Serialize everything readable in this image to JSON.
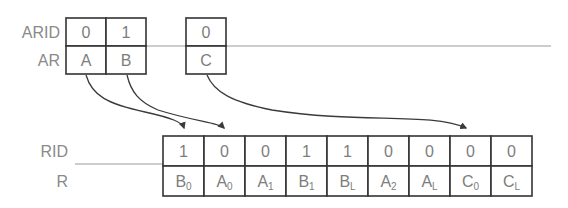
{
  "diagram": {
    "colors": {
      "background": "#ffffff",
      "box_stroke": "#333333",
      "cell_text": "#7d7d7d",
      "label_text": "#8a8a8a",
      "arrow_stroke": "#3a3a3a",
      "guide_line": "#9a9a9a"
    },
    "address_channel": {
      "labels": {
        "id_row": "ARID",
        "payload_row": "AR"
      },
      "groups": [
        {
          "name": "group-ab",
          "cells": [
            {
              "id": "0",
              "payload": "A"
            },
            {
              "id": "1",
              "payload": "B"
            }
          ]
        },
        {
          "name": "group-c",
          "cells": [
            {
              "id": "0",
              "payload": "C"
            }
          ]
        }
      ]
    },
    "read_data_channel": {
      "labels": {
        "id_row": "RID",
        "payload_row": "R"
      },
      "cells": [
        {
          "id": "1",
          "base": "B",
          "sub": "0"
        },
        {
          "id": "0",
          "base": "A",
          "sub": "0"
        },
        {
          "id": "0",
          "base": "A",
          "sub": "1"
        },
        {
          "id": "1",
          "base": "B",
          "sub": "1"
        },
        {
          "id": "1",
          "base": "B",
          "sub": "L"
        },
        {
          "id": "0",
          "base": "A",
          "sub": "2"
        },
        {
          "id": "0",
          "base": "A",
          "sub": "L"
        },
        {
          "id": "0",
          "base": "C",
          "sub": "0"
        },
        {
          "id": "0",
          "base": "C",
          "sub": "L"
        }
      ]
    },
    "arrows": [
      {
        "name": "arrow-a-to-b0",
        "from": "A",
        "to": "B0"
      },
      {
        "name": "arrow-b-to-a0",
        "from": "B",
        "to": "A0"
      },
      {
        "name": "arrow-c-to-c0",
        "from": "C",
        "to": "C0"
      }
    ]
  }
}
